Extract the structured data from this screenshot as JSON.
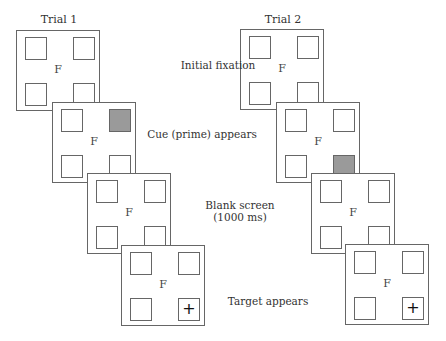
{
  "trials": [
    {
      "title": "Trial 1",
      "cue_position": "top-right",
      "target_position": "bottom-right"
    },
    {
      "title": "Trial 2",
      "cue_position": "bottom-right",
      "target_position": "bottom-right"
    }
  ],
  "fixation_symbol": "F",
  "target_symbol": "+",
  "stages": [
    {
      "label": "Initial fixation"
    },
    {
      "label": "Cue (prime) appears"
    },
    {
      "label": "Blank screen",
      "sublabel": "(1000 ms)"
    },
    {
      "label": "Target appears"
    }
  ],
  "colors": {
    "cue_fill": "#9a9a9a",
    "frame": "#666666"
  }
}
